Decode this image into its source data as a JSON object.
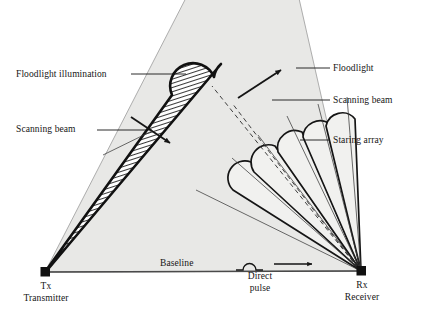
{
  "diagram": {
    "background_color": "#ffffff",
    "ink_color": "#151515",
    "floodlight_fill": "#e8e8e6",
    "lobe_fill": "#f1f1ef",
    "labels": {
      "floodlight_illumination": "Floodlight illumination",
      "scanning_beam_left": "Scanning beam",
      "floodlight_right": "Floodlight",
      "scanning_beam_right": "Scanning beam",
      "staring_array": "Staring array",
      "baseline": "Baseline",
      "direct_pulse_line1": "Direct",
      "direct_pulse_line2": "pulse",
      "tx": "Tx",
      "tx_sub": "Transmitter",
      "rx": "Rx",
      "rx_sub": "Receiver"
    },
    "nodes": {
      "transmitter": {
        "name": "Tx",
        "x": 45,
        "y": 272
      },
      "receiver": {
        "name": "Rx",
        "x": 361,
        "y": 271
      }
    },
    "elements": {
      "floodlight_cone": "shaded-sector",
      "scanning_beam": "hatched-lobe",
      "staring_array_lobes": 5,
      "sweep_arrows": 2,
      "direct_pulse_arrow": "right-arrow",
      "pulse_waveform": "single-bump"
    }
  }
}
